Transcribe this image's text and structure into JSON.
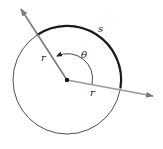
{
  "diagram": {
    "labels": {
      "arc": "s",
      "angle": "θ",
      "radius_left": "r",
      "radius_right": "r"
    },
    "colors": {
      "circle": "#3a3a3a",
      "arc": "#1a1a1a",
      "ray": "#7a7a7a",
      "center": "#111111",
      "text": "#222222"
    }
  }
}
